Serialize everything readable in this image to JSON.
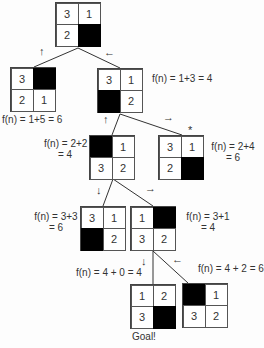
{
  "diagram": {
    "nodes": [
      {
        "id": "root",
        "cells": [
          "3",
          "1",
          "2",
          ""
        ],
        "fn_label": ""
      },
      {
        "id": "l1-left",
        "cells": [
          "3",
          "",
          "2",
          "1"
        ],
        "fn_label": "f(n) = 1+5 = 6"
      },
      {
        "id": "l1-right",
        "cells": [
          "3",
          "1",
          "",
          "2"
        ],
        "fn_label": "f(n) = 1+3 = 4"
      },
      {
        "id": "l2-left",
        "cells": [
          "",
          "1",
          "3",
          "2"
        ],
        "fn_label_line1": "f(n) = 2+2",
        "fn_label_line2": "= 4"
      },
      {
        "id": "l2-right",
        "cells": [
          "3",
          "1",
          "2",
          ""
        ],
        "fn_label_line1": "f(n) = 2+4",
        "fn_label_line2": "= 6",
        "marker": "*"
      },
      {
        "id": "l3-left",
        "cells": [
          "3",
          "1",
          "",
          "2"
        ],
        "fn_label_line1": "f(n) = 3+3",
        "fn_label_line2": "= 6"
      },
      {
        "id": "l3-right",
        "cells": [
          "1",
          "",
          "3",
          "2"
        ],
        "fn_label_line1": "f(n) = 3+1",
        "fn_label_line2": "= 4"
      },
      {
        "id": "l4-left",
        "cells": [
          "1",
          "2",
          "3",
          ""
        ],
        "fn_label": "f(n) = 4 + 0 = 4",
        "caption": "Goal!"
      },
      {
        "id": "l4-right",
        "cells": [
          "",
          "1",
          "3",
          "2"
        ],
        "fn_label": "f(n) = 4 + 2 = 6"
      }
    ],
    "moves": {
      "root_left": "↑",
      "root_right": "←",
      "l1_left": "↑",
      "l1_right": "→",
      "l2_left": "↓",
      "l2_right": "→",
      "l3_left": "↓",
      "l3_right": "←"
    }
  }
}
